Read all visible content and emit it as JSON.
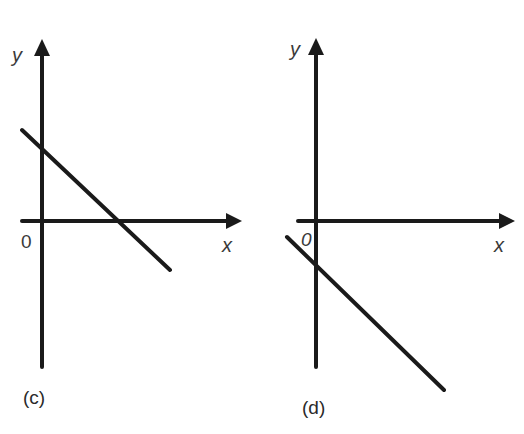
{
  "figure": {
    "panels": [
      {
        "id": "c",
        "caption": "(c)",
        "x_axis_label": "x",
        "y_axis_label": "y",
        "origin_label": "0",
        "line": {
          "description": "straight line with negative slope, positive y-intercept, positive x-intercept",
          "slope_sign": "negative",
          "y_intercept_sign": "positive",
          "x_intercept_sign": "positive"
        }
      },
      {
        "id": "d",
        "caption": "(d)",
        "x_axis_label": "x",
        "y_axis_label": "y",
        "origin_label": "0",
        "line": {
          "description": "straight line with negative slope, negative y-intercept, negative x-intercept",
          "slope_sign": "negative",
          "y_intercept_sign": "negative",
          "x_intercept_sign": "negative"
        }
      }
    ],
    "colors": {
      "ink": "#1a1a1a",
      "label": "#3a3a3a",
      "background": "#ffffff"
    }
  }
}
